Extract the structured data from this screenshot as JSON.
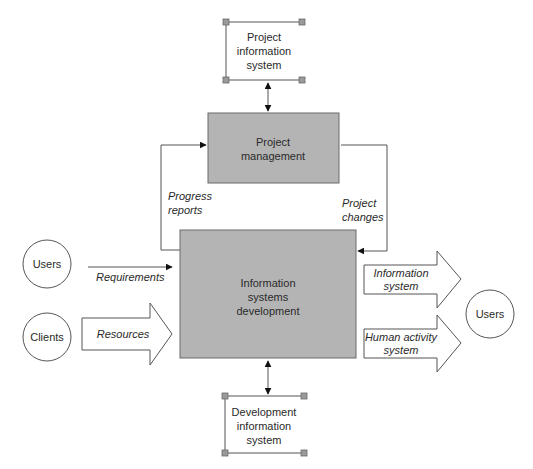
{
  "diagram": {
    "nodes": {
      "project_info_system": {
        "line1": "Project",
        "line2": "information",
        "line3": "system"
      },
      "project_management": {
        "line1": "Project",
        "line2": "management"
      },
      "is_development": {
        "line1": "Information",
        "line2": "systems",
        "line3": "development"
      },
      "dev_info_system": {
        "line1": "Development",
        "line2": "information",
        "line3": "system"
      },
      "users_left": {
        "label": "Users"
      },
      "clients": {
        "label": "Clients"
      },
      "users_right": {
        "label": "Users"
      }
    },
    "flows": {
      "progress_reports": {
        "line1": "Progress",
        "line2": "reports"
      },
      "project_changes": {
        "line1": "Project",
        "line2": "changes"
      },
      "requirements": {
        "label": "Requirements"
      },
      "resources": {
        "label": "Resources"
      },
      "information_system": {
        "line1": "Information",
        "line2": "system"
      },
      "human_activity_system": {
        "line1": "Human activity",
        "line2": "system"
      }
    },
    "colors": {
      "process_fill": "#b4b4b4",
      "line": "#555555",
      "corner_marker": "#9a9a9a"
    }
  },
  "caption": {
    "text": ""
  }
}
